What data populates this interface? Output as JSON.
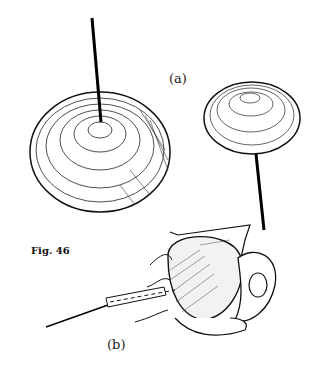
{
  "figure": {
    "caption": "Fig. 46",
    "label_a": "(a)",
    "label_b": "(b)",
    "subjects": [
      "pompom-chrysanthemum-large-wired",
      "pompom-chrysanthemum-small-stemmed",
      "rose-bud-wired"
    ]
  }
}
